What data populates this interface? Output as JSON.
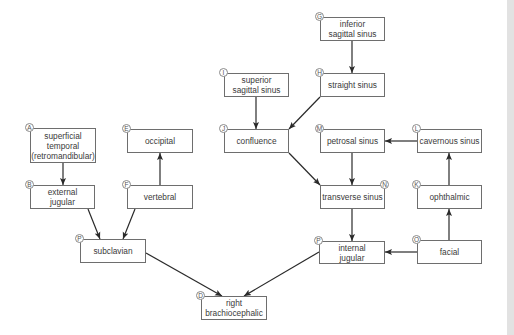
{
  "diagram": {
    "colors": {
      "box_border": "#6e6e6e",
      "arrow": "#2a2a2a",
      "text": "#3a3a3a",
      "strip": "#e2e2e2"
    },
    "nodes": [
      {
        "id": "A",
        "label": "superficial\ntemporal\n(retromandibular)",
        "x": 30,
        "y": 128,
        "w": 66,
        "h": 35,
        "badge": "A",
        "badge_pos": "tl"
      },
      {
        "id": "B",
        "label": "external\njugular",
        "x": 30,
        "y": 185,
        "w": 65,
        "h": 24,
        "badge": "B",
        "badge_pos": "tl"
      },
      {
        "id": "E",
        "label": "occipital",
        "x": 127,
        "y": 129,
        "w": 66,
        "h": 24,
        "badge": "E",
        "badge_pos": "tl"
      },
      {
        "id": "F",
        "label": "vertebral",
        "x": 127,
        "y": 185,
        "w": 66,
        "h": 24,
        "badge": "F",
        "badge_pos": "tl"
      },
      {
        "id": "P1",
        "label": "subclavian",
        "x": 80,
        "y": 239,
        "w": 66,
        "h": 24,
        "badge": "P",
        "badge_pos": "tl"
      },
      {
        "id": "D",
        "label": "right\nbrachiocephalic",
        "x": 201,
        "y": 296,
        "w": 66,
        "h": 24,
        "badge": "D",
        "badge_pos": "tl"
      },
      {
        "id": "I",
        "label": "superior\nsagittal sinus",
        "x": 224,
        "y": 73,
        "w": 65,
        "h": 24,
        "badge": "I",
        "badge_pos": "tl"
      },
      {
        "id": "J",
        "label": "confluence",
        "x": 224,
        "y": 129,
        "w": 65,
        "h": 24,
        "badge": "J",
        "badge_pos": "tl"
      },
      {
        "id": "G",
        "label": "inferior\nsagittal sinus",
        "x": 320,
        "y": 17,
        "w": 65,
        "h": 24,
        "badge": "G",
        "badge_pos": "tl"
      },
      {
        "id": "H",
        "label": "straight sinus",
        "x": 320,
        "y": 73,
        "w": 65,
        "h": 24,
        "badge": "H",
        "badge_pos": "tl"
      },
      {
        "id": "M",
        "label": "petrosal sinus",
        "x": 320,
        "y": 129,
        "w": 65,
        "h": 24,
        "badge": "M",
        "badge_pos": "tl"
      },
      {
        "id": "L",
        "label": "cavernous sinus",
        "x": 417,
        "y": 129,
        "w": 65,
        "h": 24,
        "badge": "L",
        "badge_pos": "tl"
      },
      {
        "id": "N",
        "label": "transverse sinus",
        "x": 320,
        "y": 185,
        "w": 65,
        "h": 24,
        "badge": "N",
        "badge_pos": "tr"
      },
      {
        "id": "K",
        "label": "ophthalmic",
        "x": 417,
        "y": 185,
        "w": 65,
        "h": 24,
        "badge": "K",
        "badge_pos": "tl"
      },
      {
        "id": "P2",
        "label": "internal\njugular",
        "x": 319,
        "y": 241,
        "w": 66,
        "h": 23,
        "badge": "P",
        "badge_pos": "tl"
      },
      {
        "id": "O",
        "label": "facial",
        "x": 417,
        "y": 240,
        "w": 65,
        "h": 24,
        "badge": "O",
        "badge_pos": "tl"
      }
    ],
    "edges": [
      {
        "from": "A",
        "to": "B",
        "x1": 63,
        "y1": 163,
        "x2": 63,
        "y2": 185
      },
      {
        "from": "F",
        "to": "E",
        "x1": 160,
        "y1": 185,
        "x2": 160,
        "y2": 153
      },
      {
        "from": "B",
        "to": "P1",
        "x1": 88,
        "y1": 209,
        "x2": 100,
        "y2": 239
      },
      {
        "from": "F",
        "to": "P1",
        "x1": 135,
        "y1": 209,
        "x2": 123,
        "y2": 239
      },
      {
        "from": "P1",
        "to": "D",
        "x1": 146,
        "y1": 253,
        "x2": 222,
        "y2": 296
      },
      {
        "from": "P2",
        "to": "D",
        "x1": 319,
        "y1": 252,
        "x2": 244,
        "y2": 296
      },
      {
        "from": "I",
        "to": "J",
        "x1": 256,
        "y1": 97,
        "x2": 256,
        "y2": 129
      },
      {
        "from": "G",
        "to": "H",
        "x1": 352,
        "y1": 41,
        "x2": 352,
        "y2": 73
      },
      {
        "from": "H",
        "to": "J",
        "x1": 320,
        "y1": 97,
        "x2": 289,
        "y2": 129
      },
      {
        "from": "J",
        "to": "N",
        "x1": 289,
        "y1": 153,
        "x2": 320,
        "y2": 185
      },
      {
        "from": "M",
        "to": "N",
        "x1": 352,
        "y1": 153,
        "x2": 352,
        "y2": 185
      },
      {
        "from": "L",
        "to": "M",
        "x1": 417,
        "y1": 141,
        "x2": 385,
        "y2": 141
      },
      {
        "from": "K",
        "to": "L",
        "x1": 449,
        "y1": 185,
        "x2": 449,
        "y2": 153
      },
      {
        "from": "O",
        "to": "K",
        "x1": 449,
        "y1": 240,
        "x2": 449,
        "y2": 209
      },
      {
        "from": "N",
        "to": "P2",
        "x1": 352,
        "y1": 209,
        "x2": 352,
        "y2": 241
      },
      {
        "from": "O",
        "to": "P2",
        "x1": 417,
        "y1": 252,
        "x2": 385,
        "y2": 252
      }
    ]
  }
}
